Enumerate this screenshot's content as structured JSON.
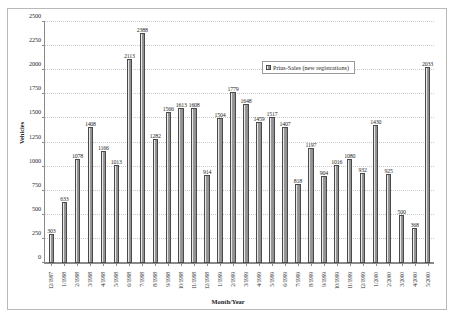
{
  "chart_data": {
    "type": "bar",
    "title": "",
    "xlabel": "Month/Year",
    "ylabel": "Vehicles",
    "ylim": [
      0,
      2500
    ],
    "ytick_step": 250,
    "yticks": [
      0,
      250,
      500,
      750,
      1000,
      1250,
      1500,
      1750,
      2000,
      2250,
      2500
    ],
    "grid": true,
    "legend_position": "top-right-inside",
    "series": [
      {
        "name": "Prius-Sales (new registrations)",
        "values": [
          303,
          633,
          1078,
          1408,
          1166,
          1013,
          2113,
          2388,
          1282,
          1566,
          1613,
          1608,
          914,
          1504,
          1779,
          1648,
          1459,
          1517,
          1407,
          818,
          1197,
          904,
          1016,
          1080,
          932,
          1430,
          925,
          500,
          368,
          2033
        ]
      }
    ],
    "categories": [
      "12/1997",
      "1/1998",
      "2/1998",
      "3/1998",
      "4/1998",
      "5/1998",
      "6/1998",
      "7/1998",
      "8/1998",
      "9/1998",
      "10/1998",
      "11/1998",
      "12/1998",
      "1/1999",
      "2/1999",
      "3/1999",
      "4/1999",
      "5/1999",
      "6/1999",
      "7/1999",
      "8/1999",
      "9/1999",
      "10/1999",
      "11/1999",
      "12/1999",
      "1/2000",
      "2/2000",
      "3/2000",
      "4/2000",
      "5/2000"
    ],
    "colors": {
      "bar_fill": "#9b9b9b",
      "bar_edge": "#4a4a4a",
      "axis": "#8a8a8a",
      "gridline": "#c9c9c9",
      "text": "#1f1f1f",
      "background": "#ffffff",
      "frame": "#b9b9b9"
    }
  },
  "legend": {
    "entries": [
      {
        "label": "Prius-Sales (new registrations)",
        "swatch": "bar-swatch"
      }
    ]
  },
  "axes": {
    "y_title": "Vehicles",
    "x_title": "Month/Year"
  }
}
